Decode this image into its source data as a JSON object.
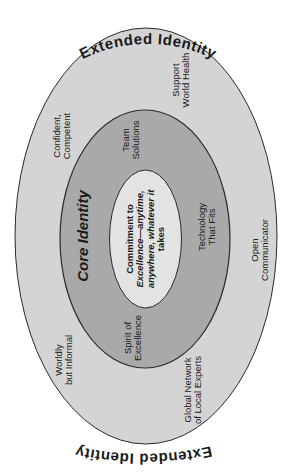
{
  "diagram": {
    "title_top": "Extended Identity",
    "title_bottom": "Extended Identity",
    "colors": {
      "outer_fill": "#d4d4d4",
      "middle_fill": "#a9a9a9",
      "inner_fill": "#e3e3e3",
      "stroke": "#2a2a2a",
      "text": "#1a1a1a"
    },
    "core": {
      "title": "Core Identity",
      "center_lines": [
        "Commitment to",
        "Excellence—anytime,",
        "anywhere, whatever it",
        "takes"
      ]
    },
    "core_labels": [
      {
        "lines": [
          "Team",
          "Solutions"
        ]
      },
      {
        "lines": [
          "Technology",
          "That Fits"
        ]
      },
      {
        "lines": [
          "Spirit of",
          "Excellence"
        ]
      }
    ],
    "extended_labels": [
      {
        "lines": [
          "Confident,",
          "Competent"
        ]
      },
      {
        "lines": [
          "Support",
          "World Health"
        ]
      },
      {
        "lines": [
          "Open",
          "Communicator"
        ]
      },
      {
        "lines": [
          "Worldly",
          "but Informal"
        ]
      },
      {
        "lines": [
          "Global Network",
          "of Local Experts"
        ]
      }
    ]
  }
}
